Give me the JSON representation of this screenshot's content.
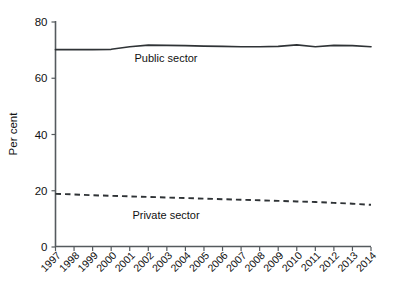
{
  "chart_data": {
    "type": "line",
    "title": "",
    "xlabel": "",
    "ylabel": "Per cent",
    "ylim": [
      0,
      80
    ],
    "yticks": [
      0,
      20,
      40,
      60,
      80
    ],
    "ytick_labels": [
      "0",
      "20",
      "40",
      "60",
      "80"
    ],
    "grid": false,
    "legend_position": "inline-annotation",
    "categories": [
      "1997",
      "1998",
      "1999",
      "2000",
      "2001",
      "2002",
      "2003",
      "2004",
      "2005",
      "2006",
      "2007",
      "2008",
      "2009",
      "2010",
      "2011",
      "2012",
      "2013",
      "2014"
    ],
    "series": [
      {
        "name": "Public sector",
        "style": "solid",
        "color": "#2f3336",
        "values": [
          70.2,
          70.2,
          70.2,
          70.3,
          71.2,
          71.8,
          71.7,
          71.6,
          71.4,
          71.3,
          71.2,
          71.2,
          71.3,
          71.9,
          71.2,
          71.7,
          71.6,
          71.2
        ],
        "annotation": {
          "text": "Public sector",
          "at_x": "2000-2001",
          "at_y": 66.0
        }
      },
      {
        "name": "Private sector",
        "style": "dashed",
        "color": "#2f3336",
        "values": [
          18.9,
          18.7,
          18.4,
          18.2,
          18.0,
          17.8,
          17.6,
          17.4,
          17.2,
          17.0,
          16.8,
          16.6,
          16.4,
          16.2,
          16.0,
          15.7,
          15.4,
          15.0
        ],
        "annotation": {
          "text": "Private sector",
          "at_x": "2000-2001",
          "at_y": 13.5
        }
      }
    ]
  },
  "axes": {
    "y_title": "Per cent",
    "y_tick_labels": [
      "80",
      "60",
      "40",
      "20",
      "0"
    ],
    "x_tick_labels": [
      "1997",
      "1998",
      "1999",
      "2000",
      "2001",
      "2002",
      "2003",
      "2004",
      "2005",
      "2006",
      "2007",
      "2008",
      "2009",
      "2010",
      "2011",
      "2012",
      "2013",
      "2014"
    ]
  },
  "annotations": {
    "public_label": "Public sector",
    "private_label": "Private sector"
  }
}
